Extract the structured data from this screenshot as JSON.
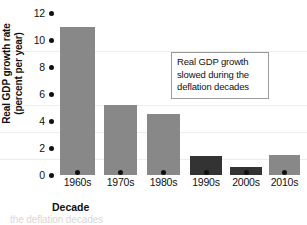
{
  "chart_data": {
    "type": "bar",
    "title": "",
    "xlabel": "Decade",
    "ylabel": "Real GDP growth rate (percent per year)",
    "ylabel_line1": "Real GDP growth rate",
    "ylabel_line2": "(percent per year)",
    "categories": [
      "1960s",
      "1970s",
      "1980s",
      "1990s",
      "2000s",
      "2010s"
    ],
    "values": [
      11.0,
      5.2,
      4.5,
      1.4,
      0.6,
      1.5
    ],
    "ylim": [
      0,
      12
    ],
    "yticks": [
      12,
      10,
      8,
      6,
      4,
      2,
      0
    ],
    "ytick_labels": [
      "12",
      "10",
      "8",
      "6",
      "4",
      "2",
      "0"
    ],
    "grid": true,
    "legend": "none",
    "bar_colors": [
      "#888888",
      "#888888",
      "#888888",
      "#333333",
      "#333333",
      "#888888"
    ],
    "highlight_color": "#333333",
    "normal_color": "#888888",
    "bars": [
      {
        "category": "1960s",
        "value": 11.0,
        "color": "#888888",
        "highlighted": false
      },
      {
        "category": "1970s",
        "value": 5.2,
        "color": "#888888",
        "highlighted": false
      },
      {
        "category": "1980s",
        "value": 4.5,
        "color": "#888888",
        "highlighted": false
      },
      {
        "category": "1990s",
        "value": 1.4,
        "color": "#333333",
        "highlighted": true
      },
      {
        "category": "2000s",
        "value": 0.6,
        "color": "#333333",
        "highlighted": true
      },
      {
        "category": "2010s",
        "value": 1.5,
        "color": "#888888",
        "highlighted": false
      }
    ],
    "annotations": [
      {
        "id": "deflation-note",
        "line1": "Real GDP growth",
        "line2": "slowed during the",
        "line3": "deflation decades"
      }
    ]
  },
  "caption": {
    "text": "the deflation decades"
  }
}
